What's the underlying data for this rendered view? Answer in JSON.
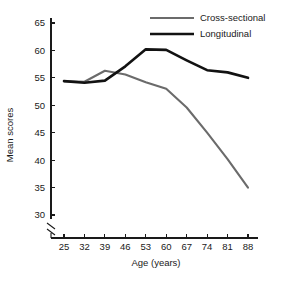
{
  "chart_data": {
    "type": "line",
    "title": "",
    "xlabel": "Age (years)",
    "ylabel": "Mean scores",
    "x": [
      25,
      32,
      39,
      46,
      53,
      60,
      67,
      74,
      81,
      88
    ],
    "xtick_labels": [
      "25",
      "32",
      "39",
      "46",
      "53",
      "60",
      "67",
      "74",
      "81",
      "88"
    ],
    "ytick_labels": [
      "30",
      "35",
      "40",
      "45",
      "50",
      "55",
      "60",
      "65"
    ],
    "ytick_values": [
      30,
      35,
      40,
      45,
      50,
      55,
      60,
      65
    ],
    "ylim": [
      30,
      65
    ],
    "xlim": [
      25,
      88
    ],
    "grid": false,
    "axis_break": true,
    "axis_break_note": "y-axis broken below 30",
    "legend_position": "top-right",
    "series": [
      {
        "name": "Cross-sectional",
        "color": "#6b6b6b",
        "width": 2.1,
        "values": [
          54.4,
          54.3,
          56.3,
          55.6,
          54.2,
          53.0,
          49.6,
          45.0,
          40.2,
          35.0
        ]
      },
      {
        "name": "Longitudinal",
        "color": "#121212",
        "width": 2.6,
        "values": [
          54.4,
          54.1,
          54.5,
          57.1,
          60.2,
          60.1,
          58.2,
          56.4,
          56.0,
          55.0
        ]
      }
    ]
  },
  "legend": {
    "items": [
      {
        "label": "Cross-sectional"
      },
      {
        "label": "Longitudinal"
      }
    ]
  },
  "axes": {
    "x_title": "Age (years)",
    "y_title": "Mean scores"
  }
}
